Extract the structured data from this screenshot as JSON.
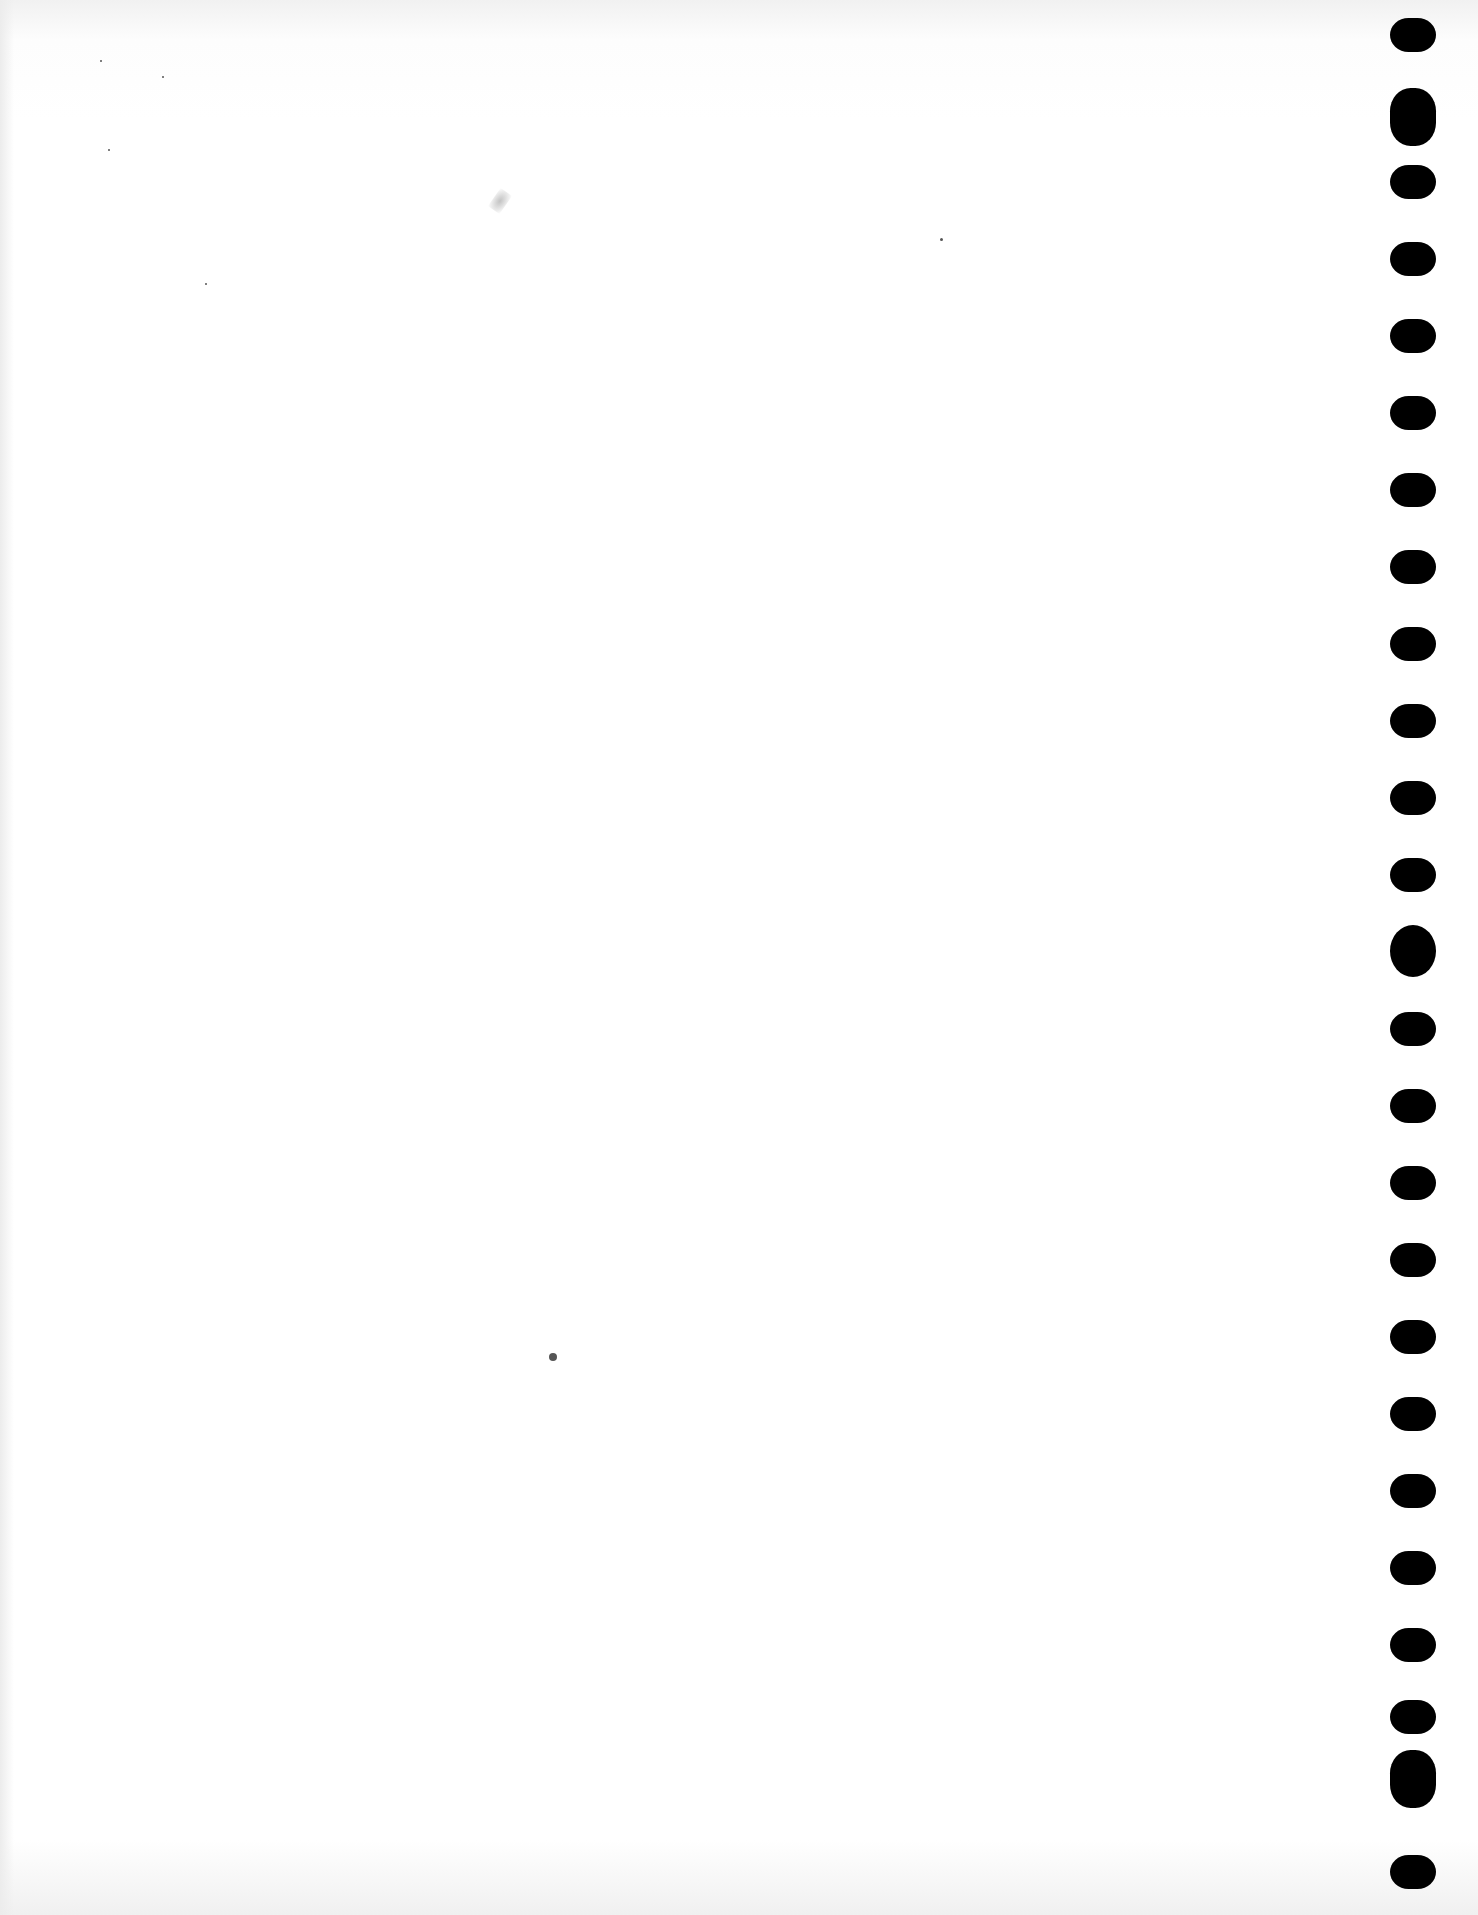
{
  "document": {
    "type": "blank scanned page",
    "text_content": "",
    "background_color": "#ffffff",
    "binding": {
      "side": "right",
      "hole_color": "#000000",
      "holes": [
        {
          "y": 18,
          "shape": "oval"
        },
        {
          "y": 88,
          "shape": "double"
        },
        {
          "y": 165,
          "shape": "oval"
        },
        {
          "y": 242,
          "shape": "oval"
        },
        {
          "y": 319,
          "shape": "oval"
        },
        {
          "y": 396,
          "shape": "oval"
        },
        {
          "y": 473,
          "shape": "oval"
        },
        {
          "y": 550,
          "shape": "oval"
        },
        {
          "y": 627,
          "shape": "oval"
        },
        {
          "y": 704,
          "shape": "oval"
        },
        {
          "y": 781,
          "shape": "oval"
        },
        {
          "y": 858,
          "shape": "oval"
        },
        {
          "y": 925,
          "shape": "round"
        },
        {
          "y": 1012,
          "shape": "oval"
        },
        {
          "y": 1089,
          "shape": "oval"
        },
        {
          "y": 1166,
          "shape": "oval"
        },
        {
          "y": 1243,
          "shape": "oval"
        },
        {
          "y": 1320,
          "shape": "oval"
        },
        {
          "y": 1397,
          "shape": "oval"
        },
        {
          "y": 1474,
          "shape": "oval"
        },
        {
          "y": 1551,
          "shape": "oval"
        },
        {
          "y": 1628,
          "shape": "oval"
        },
        {
          "y": 1700,
          "shape": "oval"
        },
        {
          "y": 1750,
          "shape": "double"
        },
        {
          "y": 1855,
          "shape": "oval"
        }
      ]
    },
    "marks": [
      {
        "x": 549,
        "y": 1353,
        "size": 8,
        "kind": "speck"
      },
      {
        "x": 940,
        "y": 238,
        "size": 3,
        "kind": "speck"
      },
      {
        "x": 100,
        "y": 60,
        "size": 2,
        "kind": "speck"
      },
      {
        "x": 162,
        "y": 76,
        "size": 2,
        "kind": "speck"
      },
      {
        "x": 108,
        "y": 149,
        "size": 2,
        "kind": "speck"
      },
      {
        "x": 205,
        "y": 283,
        "size": 2,
        "kind": "speck"
      },
      {
        "x": 493,
        "y": 190,
        "size": 0,
        "kind": "smudge"
      }
    ]
  }
}
